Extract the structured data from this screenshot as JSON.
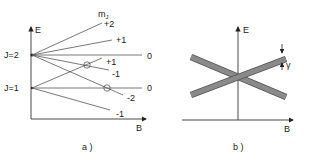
{
  "panel_a": {
    "caption": "a )",
    "axis_x_label": "B",
    "axis_y_label": "E",
    "header_label": "m",
    "header_sub": "J",
    "levels": [
      {
        "label": "J=2",
        "name": "j2"
      },
      {
        "label": "J=1",
        "name": "j1"
      }
    ],
    "lines": [
      {
        "level": "J=2",
        "mJ": "+2"
      },
      {
        "level": "J=2",
        "mJ": "+1"
      },
      {
        "level": "J=2",
        "mJ": "0"
      },
      {
        "level": "J=2",
        "mJ": "-1"
      },
      {
        "level": "J=2",
        "mJ": "-2"
      },
      {
        "level": "J=1",
        "mJ": "+1"
      },
      {
        "level": "J=1",
        "mJ": "0"
      },
      {
        "level": "J=1",
        "mJ": "-1"
      }
    ],
    "crossings_marked": 2
  },
  "panel_b": {
    "caption": "b )",
    "axis_x_label": "B",
    "axis_y_label": "E",
    "width_label": "γ",
    "bands": [
      "ascending",
      "descending"
    ]
  }
}
